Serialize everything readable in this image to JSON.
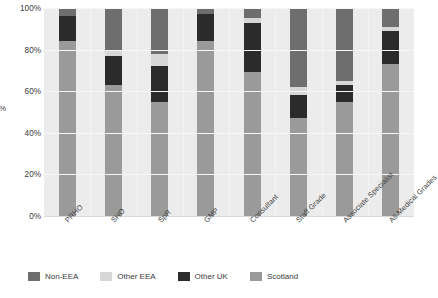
{
  "chart_data": {
    "type": "bar",
    "stacked": true,
    "normalized_percent": true,
    "title": "",
    "xlabel": "",
    "ylabel": "%",
    "ylim": [
      0,
      100
    ],
    "yticks": [
      "0%",
      "20%",
      "40%",
      "60%",
      "80%",
      "100%"
    ],
    "ytick_values": [
      0,
      20,
      40,
      60,
      80,
      100
    ],
    "grid": true,
    "legend_position": "bottom",
    "categories": [
      "PRHO",
      "SHO",
      "SpR",
      "GMP",
      "Consultant",
      "Staff Grade",
      "Associate Specialist",
      "All Medical Grades"
    ],
    "series": [
      {
        "name": "Scotland",
        "color": "#9a9a9a",
        "values": [
          84,
          63,
          55,
          84,
          69,
          47,
          55,
          73
        ]
      },
      {
        "name": "Other UK",
        "color": "#2b2b2b",
        "values": [
          12,
          14,
          17,
          13,
          24,
          11,
          8,
          16
        ]
      },
      {
        "name": "Other EEA",
        "color": "#d7d7d7",
        "values": [
          0,
          3,
          6,
          0,
          2,
          4,
          2,
          2
        ]
      },
      {
        "name": "Non-EEA",
        "color": "#6e6e6e",
        "values": [
          4,
          20,
          22,
          3,
          5,
          38,
          35,
          9
        ]
      }
    ],
    "legend_entries": [
      "Non-EEA",
      "Other EEA",
      "Other UK",
      "Scotland"
    ],
    "legend_colors": [
      "#6e6e6e",
      "#d7d7d7",
      "#2b2b2b",
      "#9a9a9a"
    ],
    "plot_background": "#ececec",
    "gridline_color": "#f7f7f7"
  }
}
